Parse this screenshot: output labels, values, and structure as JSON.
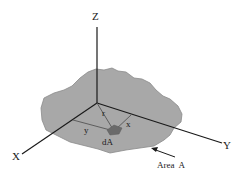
{
  "diagram": {
    "type": "3d-coordinate-area-element",
    "colors": {
      "background": "#ffffff",
      "area_fill": "#a8a8a8",
      "area_stroke": "#8a8a8a",
      "element_fill": "#6a6a6a",
      "axis_stroke": "#1a1a1a",
      "line_stroke": "#555555"
    },
    "axes": {
      "z": {
        "label": "Z"
      },
      "x": {
        "label": "X"
      },
      "y": {
        "label": "Y"
      }
    },
    "distances": {
      "r": "r",
      "x": "x",
      "y": "y"
    },
    "element": {
      "label": "dA"
    },
    "area": {
      "label": "Area  A"
    }
  }
}
